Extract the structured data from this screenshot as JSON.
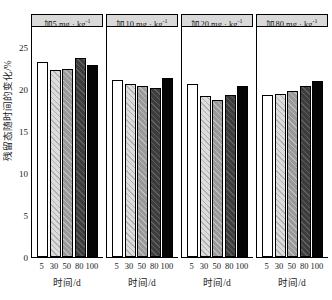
{
  "chart_data": {
    "type": "bar",
    "title": "",
    "xlabel": "时间/d",
    "ylabel": "残留态随时间的变化/%",
    "ylim": [
      0,
      27.5
    ],
    "yticks": [
      0,
      5,
      10,
      15,
      20,
      25
    ],
    "ytick_labels": [
      "0",
      "5",
      "10",
      "15",
      "20",
      "25"
    ],
    "categories": [
      "5",
      "30",
      "50",
      "80",
      "100"
    ],
    "grid": false,
    "legend": "none",
    "panels": [
      {
        "title": "加5 mg · kg",
        "title_sup": "-1",
        "values": [
          23.2,
          22.3,
          22.4,
          23.7,
          22.8
        ]
      },
      {
        "title": "加10 mg · kg",
        "title_sup": "-1",
        "values": [
          21.1,
          20.6,
          20.4,
          20.1,
          21.3
        ]
      },
      {
        "title": "加20 mg · kg",
        "title_sup": "-1",
        "values": [
          20.6,
          19.2,
          18.7,
          19.3,
          20.4
        ]
      },
      {
        "title": "加80 mg · kg",
        "title_sup": "-1",
        "values": [
          19.3,
          19.4,
          19.8,
          20.4,
          21.0
        ]
      }
    ],
    "series_fill_names": [
      "white",
      "light-gray-hatched",
      "medium-gray-hatched",
      "dark-gray-hatched",
      "black"
    ],
    "colors": {
      "bar_white": "#ffffff",
      "bar_light": "#dcdcdc",
      "bar_medium": "#9a9a9a",
      "bar_dark": "#3d3d3d",
      "bar_black": "#050505",
      "title_band": "#d9d9d9",
      "axis": "#000000"
    }
  }
}
